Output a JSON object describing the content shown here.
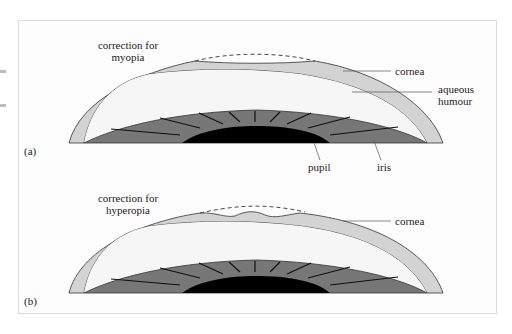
{
  "figure": {
    "panels": [
      {
        "id": "a",
        "label": "(a)",
        "title_line1": "correction for",
        "title_line2": "myopia",
        "labels": {
          "cornea": "cornea",
          "aqueous_line1": "aqueous",
          "aqueous_line2": "humour",
          "pupil": "pupil",
          "iris": "iris"
        }
      },
      {
        "id": "b",
        "label": "(b)",
        "title_line1": "correction for",
        "title_line2": "hyperopia",
        "labels": {
          "cornea": "cornea"
        }
      }
    ],
    "colors": {
      "cornea": "#d3d3d3",
      "aqueous": "#f6f6f6",
      "iris": "#777777",
      "pupil": "#000000",
      "outline": "#333333",
      "frame": "#dcdcdc"
    }
  }
}
